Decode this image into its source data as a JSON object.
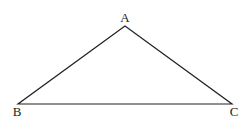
{
  "diagram": {
    "type": "triangle",
    "stroke_color": "#222222",
    "background": "#ffffff",
    "vertices": [
      {
        "label": "A",
        "x": 125,
        "y": 26
      },
      {
        "label": "B",
        "x": 18,
        "y": 104
      },
      {
        "label": "C",
        "x": 232,
        "y": 104
      }
    ],
    "labels": {
      "a": "A",
      "b": "B",
      "c": "C"
    }
  }
}
